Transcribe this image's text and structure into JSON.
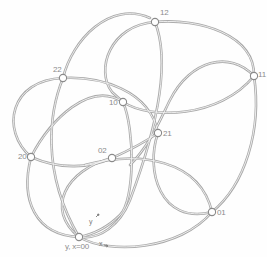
{
  "diagram": {
    "type": "graph-of-loops",
    "colors": {
      "edge": "#a9a9a9",
      "edge_inner": "#f4f4f4",
      "node_fill": "#ffffff",
      "node_stroke": "#8a8a8a",
      "label": "#8c8c8c"
    },
    "nodes": [
      {
        "id": "12",
        "label": "12",
        "x": 155,
        "y": 22
      },
      {
        "id": "22",
        "label": "22",
        "x": 63,
        "y": 78
      },
      {
        "id": "10",
        "label": "10",
        "x": 123,
        "y": 102
      },
      {
        "id": "11",
        "label": "11",
        "x": 254,
        "y": 76
      },
      {
        "id": "21",
        "label": "21",
        "x": 158,
        "y": 133
      },
      {
        "id": "20",
        "label": "20",
        "x": 31,
        "y": 157
      },
      {
        "id": "02",
        "label": "02",
        "x": 112,
        "y": 158
      },
      {
        "id": "01",
        "label": "01",
        "x": 212,
        "y": 212
      },
      {
        "id": "00",
        "label": "y, x=00",
        "x": 79,
        "y": 237
      }
    ],
    "axis_markers": [
      {
        "label": "y",
        "arrow": "↗"
      },
      {
        "label": "x",
        "arrow": "→"
      }
    ]
  }
}
